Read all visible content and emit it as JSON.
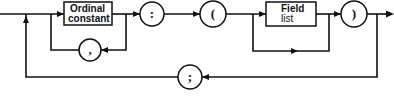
{
  "diagram": {
    "type": "syntax-railroad-diagram",
    "nodes": {
      "ordinal_constant": {
        "kind": "box",
        "line1": "Ordinal",
        "line2": "constant",
        "superscript": "'"
      },
      "comma": {
        "kind": "circle",
        "symbol": ","
      },
      "colon": {
        "kind": "circle",
        "symbol": ":"
      },
      "open_paren": {
        "kind": "circle",
        "symbol": "("
      },
      "field_list": {
        "kind": "box",
        "line1": "Field",
        "line2": "list"
      },
      "close_paren": {
        "kind": "circle",
        "symbol": ")"
      },
      "semicolon": {
        "kind": "circle",
        "symbol": ";"
      }
    },
    "edges": [
      {
        "from": "entry",
        "to": "ordinal_constant"
      },
      {
        "from": "ordinal_constant",
        "to": "colon"
      },
      {
        "from": "ordinal_constant",
        "to": "comma",
        "note": "repeat loop"
      },
      {
        "from": "comma",
        "to": "ordinal_constant"
      },
      {
        "from": "colon",
        "to": "open_paren"
      },
      {
        "from": "open_paren",
        "to": "field_list"
      },
      {
        "from": "open_paren",
        "to": "close_paren",
        "note": "bypass (field list optional)"
      },
      {
        "from": "field_list",
        "to": "close_paren"
      },
      {
        "from": "close_paren",
        "to": "exit"
      },
      {
        "from": "close_paren",
        "to": "semicolon",
        "note": "outer repeat loop"
      },
      {
        "from": "semicolon",
        "to": "ordinal_constant"
      }
    ]
  }
}
